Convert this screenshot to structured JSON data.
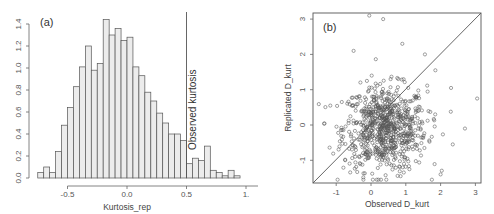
{
  "chart_data": [
    {
      "type": "bar",
      "panel": "(a)",
      "title": "",
      "xlabel": "Kurtosis_rep",
      "ylabel": "",
      "xlim": [
        -0.75,
        1.2
      ],
      "ylim": [
        0,
        1.4
      ],
      "xticks": [
        "-0.5",
        "0.0",
        "0.5",
        "1.0"
      ],
      "yticks": [
        "0.0",
        "0.2",
        "0.4",
        "0.6",
        "0.8",
        "1.0",
        "1.2",
        "1.4"
      ],
      "bin_width": 0.05,
      "bin_starts": [
        -0.75,
        -0.7,
        -0.65,
        -0.6,
        -0.55,
        -0.5,
        -0.45,
        -0.4,
        -0.35,
        -0.3,
        -0.25,
        -0.2,
        -0.15,
        -0.1,
        -0.05,
        0.0,
        0.05,
        0.1,
        0.15,
        0.2,
        0.25,
        0.3,
        0.35,
        0.4,
        0.45,
        0.5,
        0.55,
        0.6,
        0.65,
        0.7,
        0.75,
        0.8,
        0.85,
        0.9
      ],
      "values": [
        0.05,
        0.1,
        0.05,
        0.24,
        0.48,
        0.64,
        0.83,
        1.01,
        1.2,
        0.98,
        1.04,
        1.44,
        1.3,
        1.36,
        1.25,
        1.28,
        1.01,
        0.93,
        0.78,
        0.7,
        0.59,
        0.5,
        0.4,
        0.4,
        0.34,
        0.13,
        0.18,
        0.16,
        0.29,
        0.07,
        0.05,
        0.02,
        0.07,
        0.02
      ],
      "vline": {
        "x": 0.5,
        "label": "Observed kurtosis"
      },
      "grid": false,
      "fill_color": "#ececec",
      "edge_color": "#555555"
    },
    {
      "type": "scatter",
      "panel": "(b)",
      "title": "",
      "xlabel": "Observed D_kurt",
      "ylabel": "Replicated D_kurt",
      "xlim": [
        -1.7,
        3.1
      ],
      "ylim": [
        -1.7,
        3.1
      ],
      "xticks": [
        "-1",
        "0",
        "1",
        "2",
        "3"
      ],
      "yticks": [
        "-1",
        "0",
        "1",
        "2",
        "3"
      ],
      "reference_line": "y = x",
      "n_points_approx": 800,
      "center": [
        0.4,
        -0.1
      ],
      "marker": "open circle",
      "grid": false
    }
  ],
  "panel_a": {
    "label": "(a)",
    "xlabel": "Kurtosis_rep",
    "vline_label": "Observed kurtosis",
    "xticks": [
      "-0.5",
      "0.0",
      "0.5",
      "1."
    ],
    "yticks": [
      "0.0",
      "0.2",
      "0.4",
      "0.6",
      "0.8",
      "1.0",
      "1.2",
      "1.4"
    ]
  },
  "panel_b": {
    "label": "(b)",
    "xlabel": "Observed D_kurt",
    "ylabel": "Replicated D_kurt",
    "xticks": [
      "-1",
      "0",
      "1",
      "2",
      "3"
    ],
    "yticks": [
      "-1",
      "0",
      "1",
      "2",
      "3"
    ]
  }
}
